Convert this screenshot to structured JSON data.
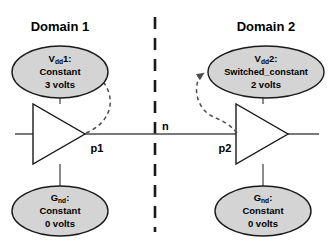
{
  "figure": {
    "background": "#ffffff",
    "stroke_color": "#1a1a1a",
    "node_fill": "#d4d4d4",
    "dash_color": "#4d4d4d"
  },
  "domains": [
    {
      "title": "Domain 1",
      "supply": {
        "name": "V",
        "subscript": "dd",
        "index": "1:",
        "type": "Constant",
        "value": "3 volts"
      },
      "ground": {
        "name": "G",
        "subscript": "nd",
        "index": ":",
        "type": "Constant",
        "value": "0 volts"
      },
      "port": "p1"
    },
    {
      "title": "Domain 2",
      "supply": {
        "name": "V",
        "subscript": "dd",
        "index": "2:",
        "type": "Switched_constant",
        "value": "2 volts"
      },
      "ground": {
        "name": "G",
        "subscript": "nd",
        "index": ":",
        "type": "Constant",
        "value": "0 volts"
      },
      "port": "p2"
    }
  ],
  "net": {
    "label": "n"
  }
}
